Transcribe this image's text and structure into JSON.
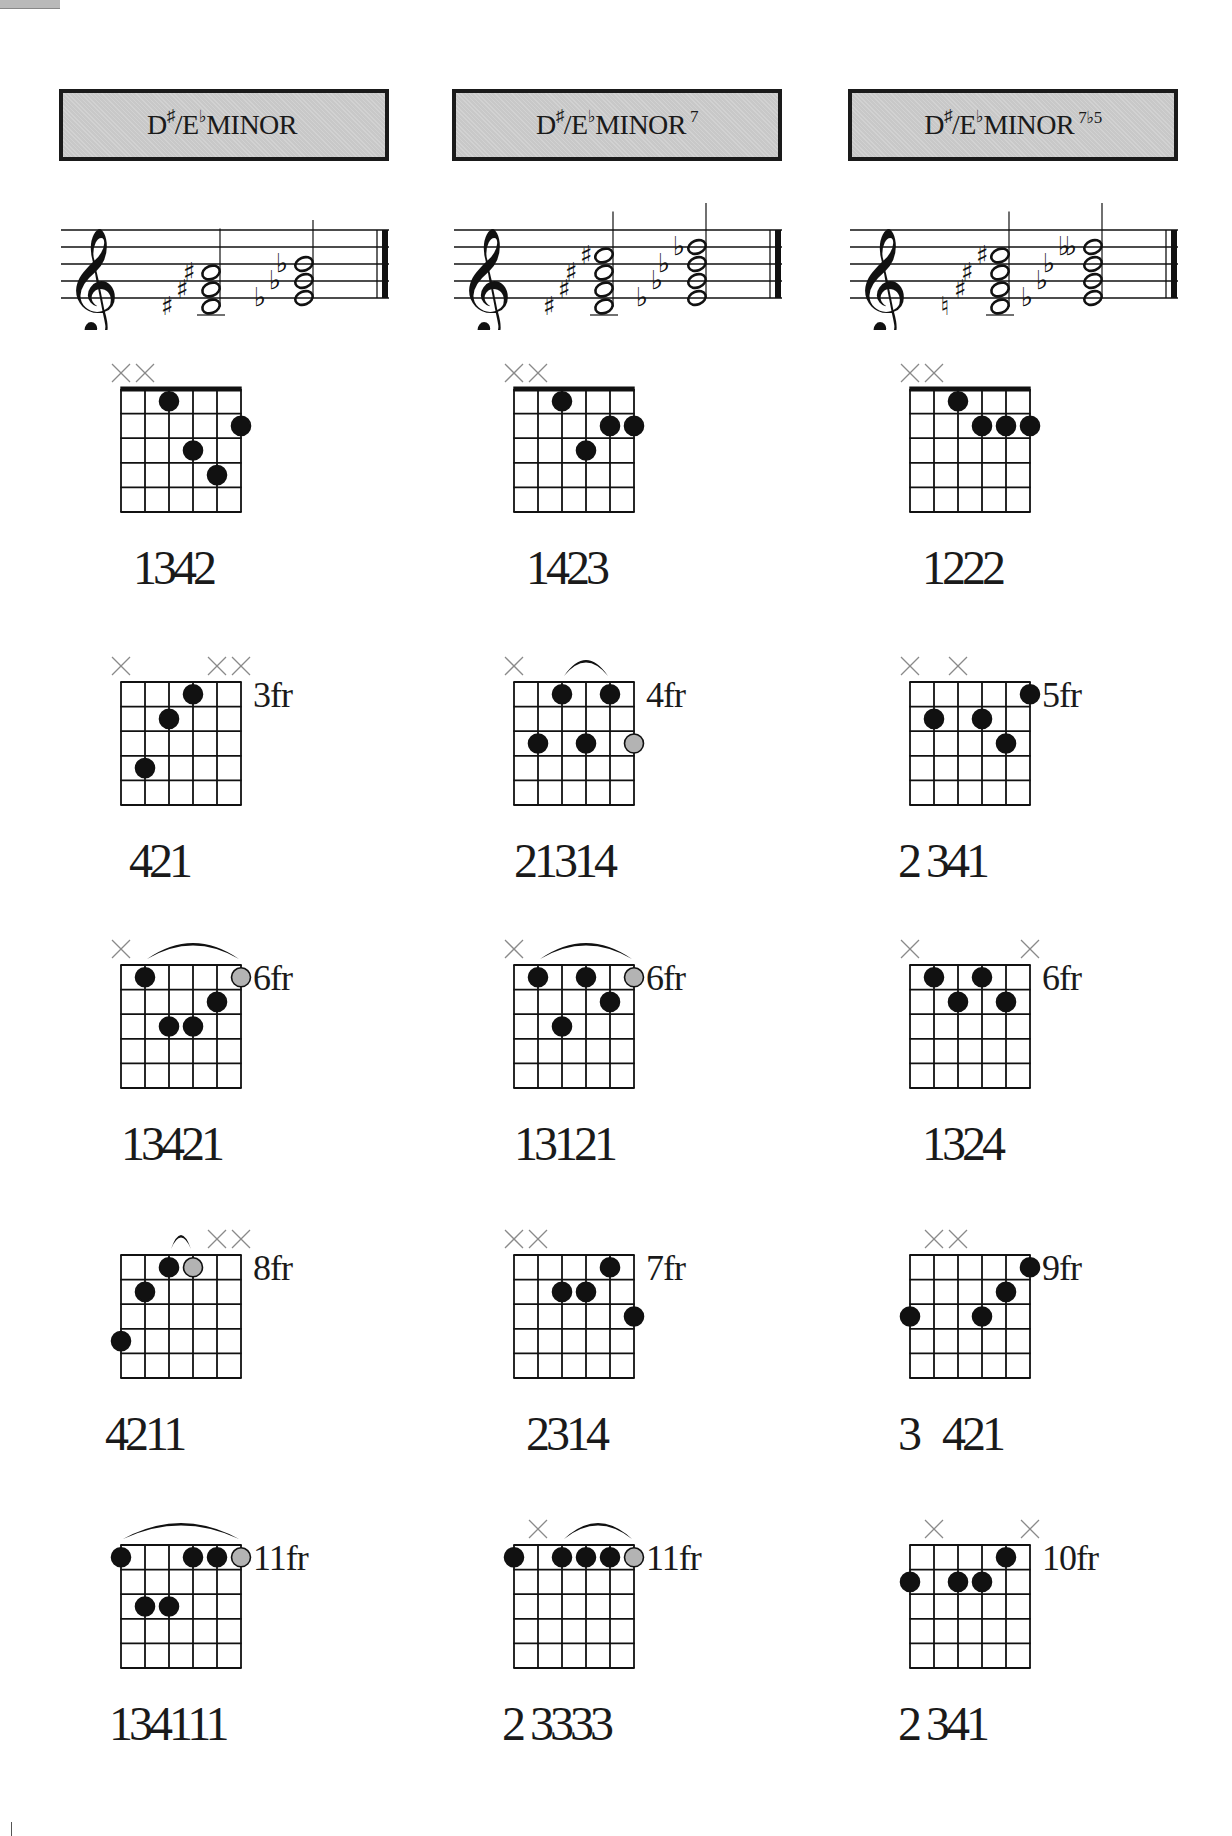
{
  "page": {
    "columns": [
      {
        "title": {
          "root": "D",
          "sharp": "♯",
          "slash": "/",
          "alt": "E",
          "flat": "♭",
          "quality": "MINOR",
          "extension": ""
        },
        "staff": {
          "chords": [
            {
              "accidentals": [
                "♯",
                "♯",
                "♯"
              ],
              "notes": [
                "D#4",
                "F#4",
                "A#4"
              ]
            },
            {
              "accidentals": [
                "♭",
                "♭",
                "♭"
              ],
              "notes": [
                "Eb4",
                "Gb4",
                "Bb4"
              ]
            }
          ]
        },
        "diagrams": [
          {
            "fret_label": "",
            "fingering": "1342",
            "muted": [
              1,
              2
            ],
            "nut": true,
            "barre": null,
            "dots": [
              [
                3,
                1,
                "b"
              ],
              [
                6,
                2,
                "b"
              ],
              [
                4,
                3,
                "b"
              ],
              [
                5,
                4,
                "b"
              ]
            ]
          },
          {
            "fret_label": "3fr",
            "fingering": "421",
            "muted": [
              1,
              5,
              6
            ],
            "nut": false,
            "barre": null,
            "dots": [
              [
                4,
                1,
                "b"
              ],
              [
                3,
                2,
                "b"
              ],
              [
                2,
                4,
                "b"
              ]
            ]
          },
          {
            "fret_label": "6fr",
            "fingering": "13421",
            "muted": [
              1
            ],
            "nut": false,
            "barre": [
              2,
              6
            ],
            "dots": [
              [
                2,
                1,
                "b"
              ],
              [
                6,
                1,
                "g"
              ],
              [
                5,
                2,
                "b"
              ],
              [
                3,
                3,
                "b"
              ],
              [
                4,
                3,
                "b"
              ]
            ]
          },
          {
            "fret_label": "8fr",
            "fingering": "4211",
            "muted": [
              5,
              6
            ],
            "nut": false,
            "barre": [
              3,
              4
            ],
            "dots": [
              [
                3,
                1,
                "b"
              ],
              [
                4,
                1,
                "g"
              ],
              [
                2,
                2,
                "b"
              ],
              [
                1,
                4,
                "b"
              ]
            ]
          },
          {
            "fret_label": "11fr",
            "fingering": "134111",
            "muted": [],
            "nut": false,
            "barre": [
              1,
              6
            ],
            "dots": [
              [
                1,
                1,
                "b"
              ],
              [
                4,
                1,
                "b"
              ],
              [
                5,
                1,
                "b"
              ],
              [
                6,
                1,
                "g"
              ],
              [
                2,
                3,
                "b"
              ],
              [
                3,
                3,
                "b"
              ]
            ]
          }
        ]
      },
      {
        "title": {
          "root": "D",
          "sharp": "♯",
          "slash": "/",
          "alt": "E",
          "flat": "♭",
          "quality": "MINOR",
          "extension": "7"
        },
        "staff": {
          "chords": [
            {
              "accidentals": [
                "♯",
                "♯",
                "♯",
                "♯"
              ],
              "notes": [
                "D#4",
                "F#4",
                "A#4",
                "C#5"
              ]
            },
            {
              "accidentals": [
                "♭",
                "♭",
                "♭",
                "♭"
              ],
              "notes": [
                "Eb4",
                "Gb4",
                "Bb4",
                "Db5"
              ]
            }
          ]
        },
        "diagrams": [
          {
            "fret_label": "",
            "fingering": "1423",
            "muted": [
              1,
              2
            ],
            "nut": true,
            "barre": null,
            "dots": [
              [
                3,
                1,
                "b"
              ],
              [
                5,
                2,
                "b"
              ],
              [
                6,
                2,
                "b"
              ],
              [
                4,
                3,
                "b"
              ]
            ]
          },
          {
            "fret_label": "4fr",
            "fingering": "21314",
            "muted": [
              1
            ],
            "nut": false,
            "barre": [
              3,
              5
            ],
            "dots": [
              [
                3,
                1,
                "b"
              ],
              [
                5,
                1,
                "b"
              ],
              [
                2,
                3,
                "b"
              ],
              [
                4,
                3,
                "b"
              ],
              [
                6,
                3,
                "g"
              ]
            ]
          },
          {
            "fret_label": "6fr",
            "fingering": "13121",
            "muted": [
              1
            ],
            "nut": false,
            "barre": [
              2,
              6
            ],
            "dots": [
              [
                2,
                1,
                "b"
              ],
              [
                4,
                1,
                "b"
              ],
              [
                6,
                1,
                "g"
              ],
              [
                5,
                2,
                "b"
              ],
              [
                3,
                3,
                "b"
              ]
            ]
          },
          {
            "fret_label": "7fr",
            "fingering": "2314",
            "muted": [
              1,
              2
            ],
            "nut": false,
            "barre": null,
            "dots": [
              [
                5,
                1,
                "b"
              ],
              [
                3,
                2,
                "b"
              ],
              [
                4,
                2,
                "b"
              ],
              [
                6,
                3,
                "b"
              ]
            ]
          },
          {
            "fret_label": "11fr",
            "fingering": "2 3333",
            "muted": [
              2
            ],
            "nut": false,
            "barre": [
              3,
              6
            ],
            "dots": [
              [
                1,
                1,
                "b"
              ],
              [
                3,
                1,
                "b"
              ],
              [
                4,
                1,
                "b"
              ],
              [
                5,
                1,
                "b"
              ],
              [
                6,
                1,
                "g"
              ]
            ]
          }
        ]
      },
      {
        "title": {
          "root": "D",
          "sharp": "♯",
          "slash": "/",
          "alt": "E",
          "flat": "♭",
          "quality": "MINOR",
          "extension": "7♭5"
        },
        "staff": {
          "chords": [
            {
              "accidentals": [
                "♮",
                "♯",
                "♯",
                "♯"
              ],
              "notes": [
                "D#4",
                "F#4",
                "A4",
                "C#5"
              ]
            },
            {
              "accidentals": [
                "♭",
                "♭",
                "♭",
                "♭",
                "♭"
              ],
              "notes": [
                "Eb4",
                "Gb4",
                "Bbb4",
                "Db5"
              ]
            }
          ]
        },
        "diagrams": [
          {
            "fret_label": "",
            "fingering": "1222",
            "muted": [
              1,
              2
            ],
            "nut": true,
            "barre": null,
            "dots": [
              [
                3,
                1,
                "b"
              ],
              [
                4,
                2,
                "b"
              ],
              [
                5,
                2,
                "b"
              ],
              [
                6,
                2,
                "b"
              ]
            ]
          },
          {
            "fret_label": "5fr",
            "fingering": "2 341",
            "muted": [
              1,
              3
            ],
            "nut": false,
            "barre": null,
            "dots": [
              [
                6,
                1,
                "b"
              ],
              [
                2,
                2,
                "b"
              ],
              [
                4,
                2,
                "b"
              ],
              [
                5,
                3,
                "b"
              ]
            ]
          },
          {
            "fret_label": "6fr",
            "fingering": "1324",
            "muted": [
              1,
              6
            ],
            "nut": false,
            "barre": null,
            "dots": [
              [
                2,
                1,
                "b"
              ],
              [
                4,
                1,
                "b"
              ],
              [
                3,
                2,
                "b"
              ],
              [
                5,
                2,
                "b"
              ]
            ]
          },
          {
            "fret_label": "9fr",
            "fingering": "3   421",
            "muted": [
              2,
              3
            ],
            "nut": false,
            "barre": null,
            "dots": [
              [
                6,
                1,
                "b"
              ],
              [
                5,
                2,
                "b"
              ],
              [
                1,
                3,
                "b"
              ],
              [
                4,
                3,
                "b"
              ]
            ]
          },
          {
            "fret_label": "10fr",
            "fingering": "2 341",
            "muted": [
              2,
              6
            ],
            "nut": false,
            "barre": null,
            "dots": [
              [
                5,
                1,
                "b"
              ],
              [
                1,
                2,
                "b"
              ],
              [
                3,
                2,
                "b"
              ],
              [
                4,
                2,
                "b"
              ]
            ]
          }
        ]
      }
    ],
    "colors": {
      "box_fill": "#c8c8c8",
      "ink": "#111111",
      "muted_x": "#8a8a8a",
      "gray_dot": "#b3b3b3"
    }
  }
}
